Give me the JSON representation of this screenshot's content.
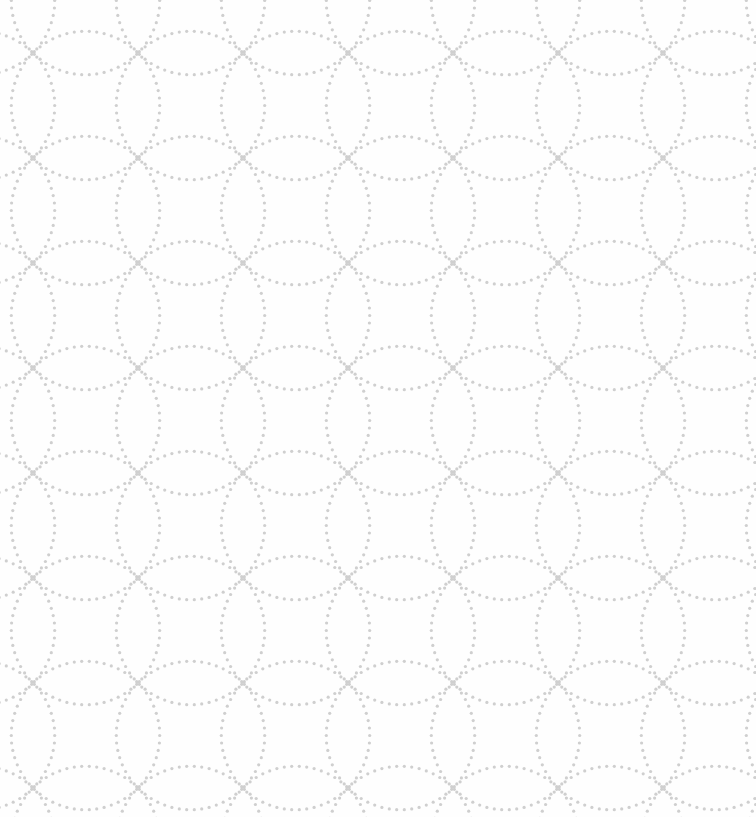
{
  "pattern": {
    "type": "dotted-interlocking-circles",
    "background_color": "#fefefe",
    "dot_color": "#cfcfcf",
    "tile_size": 105,
    "offset_x": -10,
    "offset_y": 0,
    "dot_radius": 1.6,
    "dot_spacing": 7.5
  }
}
